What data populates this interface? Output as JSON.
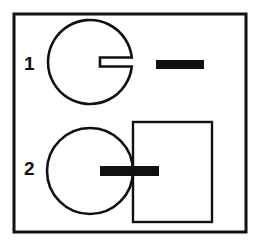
{
  "figure": {
    "title": "",
    "background_color": "#ffffff",
    "stroke_color": "#111111",
    "fill_color": "#111111",
    "frame": {
      "x": 14,
      "y": 14,
      "width": 232,
      "height": 218,
      "stroke_width": 3
    },
    "rows": [
      {
        "label": "1",
        "label_x": 24,
        "label_y": 54,
        "shapes": {
          "notched_circle": {
            "cx": 90,
            "cy": 62,
            "r": 42,
            "stroke_width": 2.6,
            "slot": {
              "y": 62,
              "x_inner": 100,
              "half_height": 4.5
            }
          },
          "bar": {
            "x": 156,
            "y": 60,
            "width": 48,
            "height": 9
          }
        }
      },
      {
        "label": "2",
        "label_x": 24,
        "label_y": 159,
        "shapes": {
          "circle": {
            "cx": 90,
            "cy": 171,
            "r": 43,
            "stroke_width": 2.6
          },
          "bar": {
            "x": 100,
            "y": 166,
            "width": 59,
            "height": 10
          },
          "square": {
            "x": 133,
            "y": 122,
            "width": 79,
            "height": 100,
            "stroke_width": 2.4
          }
        }
      }
    ]
  },
  "chart_data": {
    "type": "diagram",
    "title": "",
    "xlabel": "",
    "ylabel": "",
    "legend": [],
    "annotations": [
      "1",
      "2"
    ],
    "items": [
      {
        "row": "1",
        "elements": [
          "circle-with-horizontal-slot-open-at-right",
          "detached-black-horizontal-bar"
        ]
      },
      {
        "row": "2",
        "elements": [
          "plain-circle",
          "black-horizontal-bar-crossing-circle-edge",
          "open-square-outline"
        ]
      }
    ]
  }
}
